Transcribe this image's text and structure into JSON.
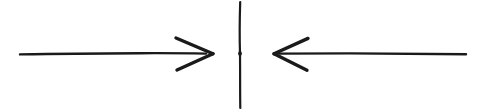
{
  "figure": {
    "title": "Opposing arrows meeting at a vertical barrier",
    "width": 485,
    "height": 112,
    "background_color": "#ffffff",
    "ink_color": "#1a1a1a",
    "style": "hand-drawn line art"
  },
  "elements": {
    "left_arrow": {
      "name": "left-arrow",
      "direction": "right",
      "semantic": "force pointing toward center from the left",
      "shaft_start_x": 20,
      "shaft_end_x": 206,
      "baseline_y": 53,
      "tip_x": 213,
      "head_back_x": 176,
      "head_top_y": 38,
      "head_bottom_y": 70,
      "color": "#1a1a1a"
    },
    "right_arrow": {
      "name": "right-arrow",
      "direction": "left",
      "semantic": "force pointing toward center from the right",
      "shaft_start_x": 466,
      "shaft_end_x": 281,
      "baseline_y": 53,
      "tip_x": 274,
      "head_back_x": 308,
      "head_top_y": 38,
      "head_bottom_y": 70,
      "color": "#1a1a1a"
    },
    "barrier_line": {
      "name": "vertical-barrier-line",
      "semantic": "vertical divider separating the two arrows",
      "x": 240,
      "top_y": 2,
      "bottom_y": 108,
      "color": "#1a1a1a"
    }
  }
}
